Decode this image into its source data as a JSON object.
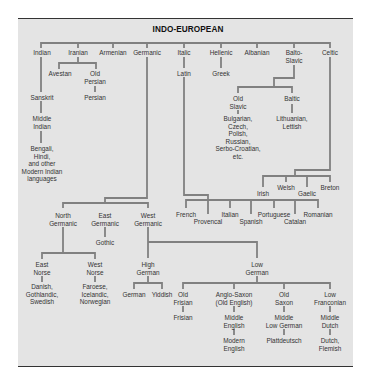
{
  "title": "INDO-EUROPEAN",
  "colors": {
    "panel_bg": "#e4e4e4",
    "line": "#808080",
    "text": "#333333",
    "rule": "#333333"
  },
  "nodes": {
    "indian": "Indian",
    "iranian": "Iranian",
    "armenian": "Armenian",
    "germanic": "Germanic",
    "italic": "Italic",
    "hellenic": "Hellenic",
    "albanian": "Albanian",
    "balto_slavic": [
      "Balto-",
      "Slavic"
    ],
    "celtic": "Celtic",
    "avestan": "Avestan",
    "old_persian": [
      "Old",
      "Persian"
    ],
    "persian": "Persian",
    "sanskrit": "Sanskrit",
    "middle_indian": [
      "Middle",
      "Indian"
    ],
    "modern_indian": [
      "Bengali,",
      "Hindi,",
      "and other",
      "Modern Indian",
      "languages"
    ],
    "latin": "Latin",
    "greek": "Greek",
    "old_slavic": [
      "Old",
      "Slavic"
    ],
    "slavic_langs": [
      "Bulgarian,",
      "Czech,",
      "Polish,",
      "Russian,",
      "Serbo-Croatian,",
      "etc."
    ],
    "baltic": "Baltic",
    "baltic_langs": [
      "Lithuanian,",
      "Lettish"
    ],
    "irish": "Irish",
    "welsh": "Welsh",
    "gaelic": "Gaelic",
    "breton": "Breton",
    "french": "French",
    "provencal": "Provencal",
    "italian": "Italian",
    "spanish": "Spanish",
    "portuguese": "Portuguese",
    "catalan": "Catalan",
    "romanian": "Romanian",
    "north_germanic": [
      "North",
      "Germanic"
    ],
    "east_germanic": [
      "East",
      "Germanic"
    ],
    "west_germanic": [
      "West",
      "Germanic"
    ],
    "gothic": "Gothic",
    "east_norse": [
      "East",
      "Norse"
    ],
    "east_norse_langs": [
      "Danish,",
      "Gothlandic,",
      "Swedish"
    ],
    "west_norse": [
      "West",
      "Norse"
    ],
    "west_norse_langs": [
      "Faroese,",
      "Icelandic,",
      "Norwegian"
    ],
    "high_german": [
      "High",
      "German"
    ],
    "german": "German",
    "yiddish": "Yiddish",
    "low_german": [
      "Low",
      "German"
    ],
    "old_frisian": [
      "Old",
      "Frisian"
    ],
    "frisian": "Frisian",
    "anglo_saxon": [
      "Anglo-Saxon",
      "(Old English)"
    ],
    "middle_english": [
      "Middle",
      "English"
    ],
    "modern_english": [
      "Modern",
      "English"
    ],
    "old_saxon": [
      "Old",
      "Saxon"
    ],
    "middle_low_german": [
      "Middle",
      "Low German"
    ],
    "plattdeutsch": "Plattdeutsch",
    "low_franconian": [
      "Low",
      "Franconian"
    ],
    "middle_dutch": [
      "Middle",
      "Dutch"
    ],
    "dutch_flemish": [
      "Dutch,",
      "Flemish"
    ]
  },
  "layout": [
    {
      "key": "indian",
      "x": 42,
      "y": 49
    },
    {
      "key": "iranian",
      "x": 78,
      "y": 49
    },
    {
      "key": "armenian",
      "x": 113,
      "y": 49
    },
    {
      "key": "germanic",
      "x": 147,
      "y": 49
    },
    {
      "key": "italic",
      "x": 184,
      "y": 49
    },
    {
      "key": "hellenic",
      "x": 221,
      "y": 49
    },
    {
      "key": "albanian",
      "x": 257,
      "y": 49
    },
    {
      "key": "balto_slavic",
      "x": 294,
      "y": 49
    },
    {
      "key": "celtic",
      "x": 330,
      "y": 49
    },
    {
      "key": "avestan",
      "x": 60,
      "y": 70
    },
    {
      "key": "old_persian",
      "x": 95,
      "y": 70
    },
    {
      "key": "persian",
      "x": 95,
      "y": 94
    },
    {
      "key": "sanskrit",
      "x": 42,
      "y": 94
    },
    {
      "key": "middle_indian",
      "x": 42,
      "y": 115
    },
    {
      "key": "modern_indian",
      "x": 42,
      "y": 145
    },
    {
      "key": "latin",
      "x": 184,
      "y": 70
    },
    {
      "key": "greek",
      "x": 221,
      "y": 70
    },
    {
      "key": "old_slavic",
      "x": 238,
      "y": 95
    },
    {
      "key": "slavic_langs",
      "x": 238,
      "y": 115
    },
    {
      "key": "baltic",
      "x": 292,
      "y": 95
    },
    {
      "key": "baltic_langs",
      "x": 292,
      "y": 115
    },
    {
      "key": "irish",
      "x": 263,
      "y": 190
    },
    {
      "key": "welsh",
      "x": 286,
      "y": 184
    },
    {
      "key": "gaelic",
      "x": 307,
      "y": 190
    },
    {
      "key": "breton",
      "x": 330,
      "y": 184
    },
    {
      "key": "french",
      "x": 186,
      "y": 211
    },
    {
      "key": "provencal",
      "x": 208,
      "y": 218
    },
    {
      "key": "italian",
      "x": 230,
      "y": 211
    },
    {
      "key": "spanish",
      "x": 251,
      "y": 218
    },
    {
      "key": "portuguese",
      "x": 274,
      "y": 211
    },
    {
      "key": "catalan",
      "x": 295,
      "y": 218
    },
    {
      "key": "romanian",
      "x": 318,
      "y": 211
    },
    {
      "key": "north_germanic",
      "x": 63,
      "y": 212
    },
    {
      "key": "east_germanic",
      "x": 105,
      "y": 212
    },
    {
      "key": "west_germanic",
      "x": 148,
      "y": 212
    },
    {
      "key": "gothic",
      "x": 105,
      "y": 239
    },
    {
      "key": "east_norse",
      "x": 42,
      "y": 261
    },
    {
      "key": "west_norse",
      "x": 95,
      "y": 261
    },
    {
      "key": "east_norse_langs",
      "x": 42,
      "y": 283
    },
    {
      "key": "west_norse_langs",
      "x": 95,
      "y": 283
    },
    {
      "key": "high_german",
      "x": 148,
      "y": 261
    },
    {
      "key": "german",
      "x": 134,
      "y": 291
    },
    {
      "key": "yiddish",
      "x": 162,
      "y": 291
    },
    {
      "key": "low_german",
      "x": 257,
      "y": 261
    },
    {
      "key": "old_frisian",
      "x": 183,
      "y": 291
    },
    {
      "key": "frisian",
      "x": 183,
      "y": 314
    },
    {
      "key": "anglo_saxon",
      "x": 234,
      "y": 291
    },
    {
      "key": "middle_english",
      "x": 234,
      "y": 314
    },
    {
      "key": "modern_english",
      "x": 234,
      "y": 337
    },
    {
      "key": "old_saxon",
      "x": 284,
      "y": 291
    },
    {
      "key": "middle_low_german",
      "x": 284,
      "y": 314
    },
    {
      "key": "plattdeutsch",
      "x": 284,
      "y": 337
    },
    {
      "key": "low_franconian",
      "x": 330,
      "y": 291
    },
    {
      "key": "middle_dutch",
      "x": 330,
      "y": 314
    },
    {
      "key": "dutch_flemish",
      "x": 330,
      "y": 337
    }
  ]
}
